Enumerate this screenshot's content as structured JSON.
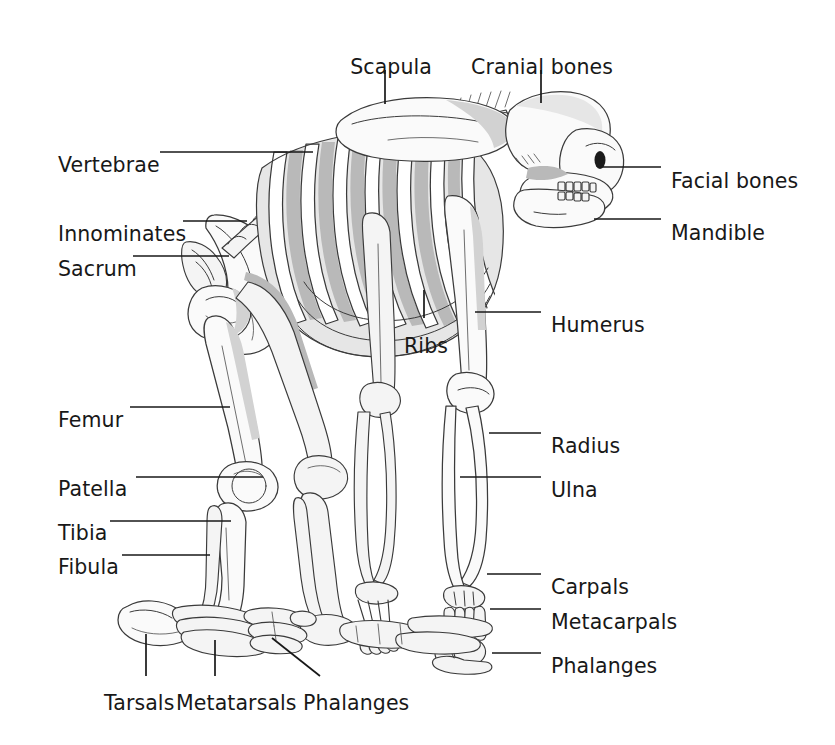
{
  "figure": {
    "background_color": "#ffffff",
    "ink_color": "#181818",
    "bone_fill": "#fafafa",
    "bone_outline": "#3a3a3a",
    "shadow_fill": "#b9b9b9",
    "mid_shadow_fill": "#d4d4d4",
    "light_shadow_fill": "#e6e6e6"
  },
  "labels": {
    "scapula": "Scapula",
    "cranial_bones": "Cranial bones",
    "vertebrae": "Vertebrae",
    "facial_bones": "Facial bones",
    "innominates": "Innominates",
    "mandible": "Mandible",
    "sacrum": "Sacrum",
    "ribs": "Ribs",
    "humerus": "Humerus",
    "femur": "Femur",
    "radius": "Radius",
    "patella": "Patella",
    "ulna": "Ulna",
    "tibia": "Tibia",
    "fibula": "Fibula",
    "carpals": "Carpals",
    "metacarpals": "Metacarpals",
    "phalanges_hand": "Phalanges",
    "tarsals": "Tarsals",
    "metatarsals": "Metatarsals",
    "phalanges_foot": "Phalanges"
  },
  "label_positions": {
    "scapula": {
      "x": 432,
      "y": 57,
      "anchor": "right"
    },
    "cranial_bones": {
      "x": 613,
      "y": 57,
      "anchor": "right"
    },
    "vertebrae": {
      "x": 58,
      "y": 155,
      "anchor": "left"
    },
    "facial_bones": {
      "x": 671,
      "y": 171,
      "anchor": "left"
    },
    "innominates": {
      "x": 58,
      "y": 224,
      "anchor": "left"
    },
    "mandible": {
      "x": 671,
      "y": 223,
      "anchor": "left"
    },
    "sacrum": {
      "x": 58,
      "y": 259,
      "anchor": "left"
    },
    "ribs": {
      "x": 404,
      "y": 336,
      "anchor": "left"
    },
    "humerus": {
      "x": 551,
      "y": 315,
      "anchor": "left"
    },
    "femur": {
      "x": 58,
      "y": 410,
      "anchor": "left"
    },
    "radius": {
      "x": 551,
      "y": 436,
      "anchor": "left"
    },
    "patella": {
      "x": 58,
      "y": 479,
      "anchor": "left"
    },
    "ulna": {
      "x": 551,
      "y": 480,
      "anchor": "left"
    },
    "tibia": {
      "x": 58,
      "y": 523,
      "anchor": "left"
    },
    "fibula": {
      "x": 58,
      "y": 557,
      "anchor": "left"
    },
    "carpals": {
      "x": 551,
      "y": 577,
      "anchor": "left"
    },
    "metacarpals": {
      "x": 551,
      "y": 612,
      "anchor": "left"
    },
    "phalanges_hand": {
      "x": 551,
      "y": 656,
      "anchor": "left"
    },
    "tarsals": {
      "x": 104,
      "y": 693,
      "anchor": "left"
    },
    "metatarsals": {
      "x": 176,
      "y": 693,
      "anchor": "left"
    },
    "phalanges_foot": {
      "x": 303,
      "y": 693,
      "anchor": "left"
    }
  },
  "leader_lines": [
    {
      "name": "scapula-leader",
      "x1": 385,
      "y1": 70,
      "x2": 385,
      "y2": 104
    },
    {
      "name": "cranial-bones-leader",
      "x1": 541,
      "y1": 70,
      "x2": 541,
      "y2": 103
    },
    {
      "name": "vertebrae-leader",
      "x1": 160,
      "y1": 152,
      "x2": 313,
      "y2": 152
    },
    {
      "name": "facial-bones-leader",
      "x1": 600,
      "y1": 167,
      "x2": 661,
      "y2": 167
    },
    {
      "name": "innominates-entry",
      "x1": 183,
      "y1": 221,
      "x2": 247,
      "y2": 221
    },
    {
      "name": "mandible-leader",
      "x1": 594,
      "y1": 219,
      "x2": 661,
      "y2": 219
    },
    {
      "name": "sacrum-leader",
      "x1": 133,
      "y1": 256,
      "x2": 229,
      "y2": 256
    },
    {
      "name": "ribs-leader",
      "x1": 424,
      "y1": 290,
      "x2": 424,
      "y2": 318
    },
    {
      "name": "humerus-leader",
      "x1": 475,
      "y1": 312,
      "x2": 541,
      "y2": 312
    },
    {
      "name": "femur-leader",
      "x1": 130,
      "y1": 407,
      "x2": 230,
      "y2": 407
    },
    {
      "name": "radius-leader",
      "x1": 489,
      "y1": 433,
      "x2": 541,
      "y2": 433
    },
    {
      "name": "patella-leader",
      "x1": 136,
      "y1": 477,
      "x2": 263,
      "y2": 477
    },
    {
      "name": "ulna-leader",
      "x1": 460,
      "y1": 477,
      "x2": 541,
      "y2": 477
    },
    {
      "name": "tibia-leader",
      "x1": 110,
      "y1": 521,
      "x2": 231,
      "y2": 521
    },
    {
      "name": "fibula-leader",
      "x1": 122,
      "y1": 555,
      "x2": 210,
      "y2": 555
    },
    {
      "name": "carpals-leader",
      "x1": 487,
      "y1": 574,
      "x2": 541,
      "y2": 574
    },
    {
      "name": "metacarpals-leader",
      "x1": 490,
      "y1": 609,
      "x2": 541,
      "y2": 609
    },
    {
      "name": "phalanges-hand-leader",
      "x1": 492,
      "y1": 653,
      "x2": 541,
      "y2": 653
    },
    {
      "name": "tarsals-leader",
      "x1": 146,
      "y1": 634,
      "x2": 146,
      "y2": 676
    },
    {
      "name": "metatarsals-leader",
      "x1": 215,
      "y1": 640,
      "x2": 215,
      "y2": 676
    },
    {
      "name": "phalanges-foot-leader",
      "x1": 272,
      "y1": 638,
      "x2": 320,
      "y2": 676
    }
  ]
}
